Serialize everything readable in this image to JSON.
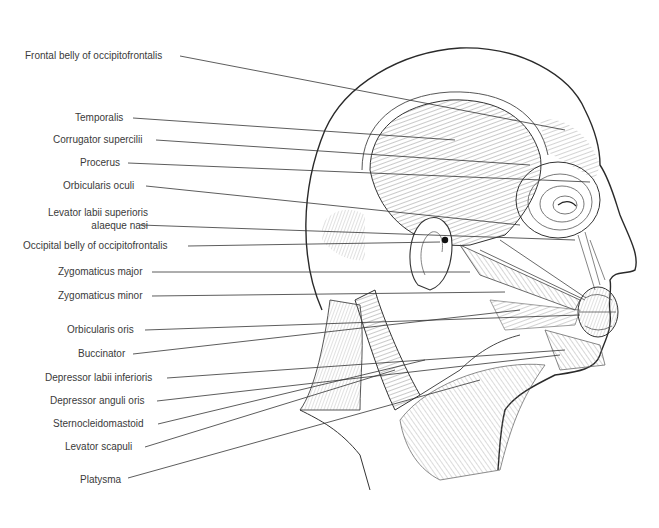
{
  "figure": {
    "type": "anatomical-illustration",
    "labels": [
      {
        "id": "frontal-belly",
        "text": "Frontal belly of occipitofrontalis",
        "x": 25,
        "y": 50,
        "lx1": 180,
        "ly1": 56,
        "lx2": 565,
        "ly2": 130
      },
      {
        "id": "temporalis",
        "text": "Temporalis",
        "x": 75,
        "y": 112,
        "lx1": 133,
        "ly1": 118,
        "lx2": 455,
        "ly2": 140
      },
      {
        "id": "corrugator",
        "text": "Corrugator supercilii",
        "x": 53,
        "y": 134,
        "lx1": 156,
        "ly1": 140,
        "lx2": 530,
        "ly2": 165
      },
      {
        "id": "procerus",
        "text": "Procerus",
        "x": 80,
        "y": 157,
        "lx1": 128,
        "ly1": 163,
        "lx2": 590,
        "ly2": 182
      },
      {
        "id": "orbicularis-oculi",
        "text": "Orbicularis oculi",
        "x": 63,
        "y": 180,
        "lx1": 146,
        "ly1": 186,
        "lx2": 520,
        "ly2": 225
      },
      {
        "id": "levator-labii",
        "text": "Levator labii superioris\nalaeque nasi",
        "x": 48,
        "y": 206,
        "lx1": 140,
        "ly1": 225,
        "lx2": 575,
        "ly2": 240
      },
      {
        "id": "occipital-belly",
        "text": "Occipital belly of occipitofrontalis",
        "x": 23,
        "y": 240,
        "lx1": 188,
        "ly1": 246,
        "lx2": 440,
        "ly2": 242
      },
      {
        "id": "zygomaticus-major",
        "text": "Zygomaticus major",
        "x": 58,
        "y": 266,
        "lx1": 152,
        "ly1": 272,
        "lx2": 470,
        "ly2": 272
      },
      {
        "id": "zygomaticus-minor",
        "text": "Zygomaticus minor",
        "x": 58,
        "y": 290,
        "lx1": 152,
        "ly1": 296,
        "lx2": 505,
        "ly2": 292
      },
      {
        "id": "orbicularis-oris",
        "text": "Orbicularis oris",
        "x": 67,
        "y": 324,
        "lx1": 145,
        "ly1": 330,
        "lx2": 580,
        "ly2": 315
      },
      {
        "id": "buccinator",
        "text": "Buccinator",
        "x": 78,
        "y": 348,
        "lx1": 133,
        "ly1": 354,
        "lx2": 520,
        "ly2": 310
      },
      {
        "id": "depressor-labii",
        "text": "Depressor labii inferioris",
        "x": 45,
        "y": 372,
        "lx1": 167,
        "ly1": 378,
        "lx2": 565,
        "ly2": 350
      },
      {
        "id": "depressor-anguli",
        "text": "Depressor anguli oris",
        "x": 50,
        "y": 395,
        "lx1": 157,
        "ly1": 401,
        "lx2": 560,
        "ly2": 355
      },
      {
        "id": "sternocleidomastoid",
        "text": "Sternocleidomastoid",
        "x": 53,
        "y": 418,
        "lx1": 158,
        "ly1": 424,
        "lx2": 425,
        "ly2": 360
      },
      {
        "id": "levator-scapuli",
        "text": "Levator scapuli",
        "x": 65,
        "y": 441,
        "lx1": 145,
        "ly1": 447,
        "lx2": 395,
        "ly2": 370
      },
      {
        "id": "platysma",
        "text": "Platysma",
        "x": 80,
        "y": 474,
        "lx1": 128,
        "ly1": 478,
        "lx2": 480,
        "ly2": 380
      }
    ]
  },
  "colors": {
    "background": "#ffffff",
    "label_text": "#3a3a3a",
    "leader_line": "#333333",
    "outline": "#2a2a2a",
    "hatch": "#6a6a6a"
  }
}
